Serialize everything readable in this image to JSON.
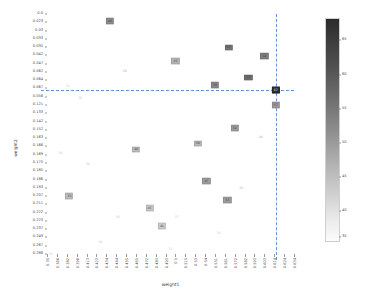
{
  "chart_data": {
    "type": "scatter",
    "title": "",
    "xlabel": "weight1",
    "ylabel": "weight2",
    "grid": false,
    "legend": "none",
    "colorbar": {
      "orientation": "vertical",
      "cmap": "grayscale-reversed",
      "vmin": 28,
      "vmax": 67,
      "ticks": [
        65,
        60,
        55,
        50,
        45,
        40,
        35
      ],
      "tick_positions_pct": [
        9.5,
        25.0,
        40.4,
        55.8,
        71.2,
        86.6,
        98.0
      ]
    },
    "xticklabels": [
      "0.35",
      "0.366",
      "0.382",
      "0.398",
      "0.413",
      "0.423",
      "0.434",
      "0.444",
      "0.455",
      "0.465",
      "0.472",
      "0.483",
      "0.493",
      "0.5",
      "0.515",
      "0.53",
      "0.54",
      "0.551",
      "0.561",
      "0.572",
      "0.582",
      "0.593",
      "0.603",
      "0.614",
      "0.624",
      "0.634"
    ],
    "yticklabels": [
      "0.0",
      "0.023",
      "0.03",
      "0.033",
      "0.035",
      "0.042",
      "0.047",
      "0.062",
      "0.064",
      "0.067",
      "0.056",
      "0.121",
      "0.133",
      "0.142",
      "0.152",
      "0.163",
      "0.166",
      "0.169",
      "0.175",
      "0.185",
      "0.186",
      "0.193",
      "0.207",
      "0.211",
      "0.222",
      "0.223",
      "0.237",
      "0.249",
      "0.267",
      "0.288"
    ],
    "highlight": {
      "x_pct": 92.6,
      "y_pct": 31.7,
      "label": "67",
      "color": "#2e2e2e"
    },
    "crosshair": {
      "x_pct": 92.6,
      "y_pct": 31.7,
      "color": "#6a8fd8",
      "style": "dashed"
    },
    "points": [
      {
        "label": "66",
        "x_pct": 25.5,
        "y_pct": 3.0,
        "color": "#8c8c8c",
        "boxed": true
      },
      {
        "label": "63",
        "x_pct": 73.5,
        "y_pct": 14.0,
        "color": "#767676",
        "boxed": true
      },
      {
        "label": "62",
        "x_pct": 88.0,
        "y_pct": 17.5,
        "color": "#7f7f7f",
        "boxed": true
      },
      {
        "label": "65",
        "x_pct": 52.0,
        "y_pct": 19.5,
        "color": "#b5b5b5",
        "boxed": true
      },
      {
        "label": "59",
        "x_pct": 31.5,
        "y_pct": 24.0,
        "color": "#b0b0b0",
        "boxed": false
      },
      {
        "label": "61",
        "x_pct": 81.5,
        "y_pct": 26.5,
        "color": "#6f6f6f",
        "boxed": true
      },
      {
        "label": "58",
        "x_pct": 68.0,
        "y_pct": 29.5,
        "color": "#8a8a8a",
        "boxed": true
      },
      {
        "label": "51",
        "x_pct": 8.5,
        "y_pct": 30.5,
        "color": "#c6c6c6",
        "boxed": false
      },
      {
        "label": "57",
        "x_pct": 92.6,
        "y_pct": 38.0,
        "color": "#9a9a9a",
        "boxed": true
      },
      {
        "label": "55",
        "x_pct": 13.5,
        "y_pct": 35.5,
        "color": "#c2c2c2",
        "boxed": false
      },
      {
        "label": "52",
        "x_pct": 76.0,
        "y_pct": 47.5,
        "color": "#9d9d9d",
        "boxed": true
      },
      {
        "label": "44",
        "x_pct": 86.5,
        "y_pct": 51.5,
        "color": "#a8a8a8",
        "boxed": false
      },
      {
        "label": "50",
        "x_pct": 61.0,
        "y_pct": 54.0,
        "color": "#b8b8b8",
        "boxed": true
      },
      {
        "label": "56",
        "x_pct": 5.5,
        "y_pct": 58.5,
        "color": "#c4c4c4",
        "boxed": false
      },
      {
        "label": "40",
        "x_pct": 36.0,
        "y_pct": 56.5,
        "color": "#bcbcbc",
        "boxed": true
      },
      {
        "label": "36",
        "x_pct": 16.5,
        "y_pct": 63.0,
        "color": "#c0c0c0",
        "boxed": false
      },
      {
        "label": "47",
        "x_pct": 64.5,
        "y_pct": 69.5,
        "color": "#9c9c9c",
        "boxed": true
      },
      {
        "label": "39",
        "x_pct": 78.5,
        "y_pct": 73.0,
        "color": "#b6b6b6",
        "boxed": false
      },
      {
        "label": "33",
        "x_pct": 9.0,
        "y_pct": 76.0,
        "color": "#bdbdbd",
        "boxed": true
      },
      {
        "label": "53",
        "x_pct": 73.0,
        "y_pct": 77.5,
        "color": "#9e9e9e",
        "boxed": true
      },
      {
        "label": "45",
        "x_pct": 41.5,
        "y_pct": 81.0,
        "color": "#c8c8c8",
        "boxed": true
      },
      {
        "label": "38",
        "x_pct": 28.5,
        "y_pct": 85.0,
        "color": "#c9c9c9",
        "boxed": false
      },
      {
        "label": "37",
        "x_pct": 52.5,
        "y_pct": 85.0,
        "color": "#c4c4c4",
        "boxed": false
      },
      {
        "label": "41",
        "x_pct": 46.5,
        "y_pct": 88.5,
        "color": "#cbcbcb",
        "boxed": true
      },
      {
        "label": "36",
        "x_pct": 69.5,
        "y_pct": 91.5,
        "color": "#cdcdcd",
        "boxed": false
      },
      {
        "label": "34",
        "x_pct": 21.5,
        "y_pct": 95.5,
        "color": "#cccccc",
        "boxed": false
      },
      {
        "label": "31",
        "x_pct": 50.0,
        "y_pct": 98.5,
        "color": "#cfcfcf",
        "boxed": false
      },
      {
        "label": "32",
        "x_pct": 1.5,
        "y_pct": 100.5,
        "color": "#d1d1d1",
        "boxed": false
      }
    ]
  }
}
